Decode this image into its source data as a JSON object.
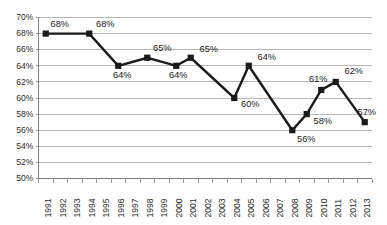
{
  "chart_data": {
    "type": "line",
    "title": "",
    "xlabel": "",
    "ylabel": "",
    "ylim": [
      50,
      70
    ],
    "ytick_step": 2,
    "grid": true,
    "legend": "none",
    "y_tick_labels": [
      "70%",
      "68%",
      "66%",
      "64%",
      "62%",
      "60%",
      "58%",
      "56%",
      "54%",
      "52%",
      "50%"
    ],
    "categories": [
      "1991",
      "1992",
      "1993",
      "1994",
      "1995",
      "1996",
      "1997",
      "1998",
      "1999",
      "2000",
      "2001",
      "2002",
      "2003",
      "2004",
      "2005",
      "2006",
      "2007",
      "2008",
      "2009",
      "2010",
      "2011",
      "2012",
      "2013"
    ],
    "series": [
      {
        "name": "Percent",
        "points": [
          {
            "x": "1991",
            "y": 68,
            "label": "68%"
          },
          {
            "x": "1994",
            "y": 68,
            "label": "68%"
          },
          {
            "x": "1996",
            "y": 64,
            "label": "64%"
          },
          {
            "x": "1998",
            "y": 65,
            "label": "65%"
          },
          {
            "x": "2000",
            "y": 64,
            "label": "64%"
          },
          {
            "x": "2001",
            "y": 65,
            "label": "65%"
          },
          {
            "x": "2004",
            "y": 60,
            "label": "60%"
          },
          {
            "x": "2005",
            "y": 64,
            "label": "64%"
          },
          {
            "x": "2008",
            "y": 56,
            "label": "56%"
          },
          {
            "x": "2009",
            "y": 58,
            "label": "58%"
          },
          {
            "x": "2010",
            "y": 61,
            "label": "61%"
          },
          {
            "x": "2011",
            "y": 62,
            "label": "62%"
          },
          {
            "x": "2013",
            "y": 57,
            "label": "57%"
          }
        ]
      }
    ],
    "colors": {
      "line": "#1a1a1a",
      "marker": "#1a1a1a",
      "gridline": "#a6a6a6",
      "axis": "#7f7f7f",
      "text": "#2b2b2b",
      "background": "#ffffff"
    },
    "label_offsets": [
      {
        "x": "1991",
        "dx": 14,
        "dy": -9
      },
      {
        "x": "1994",
        "dx": 16,
        "dy": -9
      },
      {
        "x": "1996",
        "dx": 4,
        "dy": 10
      },
      {
        "x": "1998",
        "dx": 15,
        "dy": -9
      },
      {
        "x": "2000",
        "dx": 2,
        "dy": 10
      },
      {
        "x": "2001",
        "dx": 18,
        "dy": -8
      },
      {
        "x": "2004",
        "dx": 16,
        "dy": 7
      },
      {
        "x": "2005",
        "dx": 18,
        "dy": -8
      },
      {
        "x": "2008",
        "dx": 14,
        "dy": 9
      },
      {
        "x": "2009",
        "dx": 16,
        "dy": 7
      },
      {
        "x": "2010",
        "dx": -3,
        "dy": -10
      },
      {
        "x": "2011",
        "dx": 18,
        "dy": -10
      },
      {
        "x": "2013",
        "dx": 2,
        "dy": -10
      }
    ]
  }
}
